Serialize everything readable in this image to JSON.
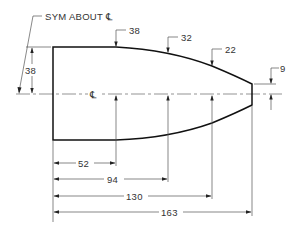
{
  "drawing": {
    "type": "dimensioned profile drawing",
    "note": "SYM ABOUT ℄",
    "centerline_symbol": "℄",
    "height_dimensions": [
      {
        "name": "half-height-left",
        "value": "38"
      },
      {
        "name": "half-height-at-52",
        "value": "38"
      },
      {
        "name": "half-height-at-94",
        "value": "32"
      },
      {
        "name": "half-height-at-130",
        "value": "22"
      },
      {
        "name": "half-height-tip",
        "value": "9"
      }
    ],
    "length_dimensions": [
      {
        "name": "station-52",
        "value": "52"
      },
      {
        "name": "station-94",
        "value": "94"
      },
      {
        "name": "station-130",
        "value": "130"
      },
      {
        "name": "station-163",
        "value": "163"
      }
    ]
  }
}
